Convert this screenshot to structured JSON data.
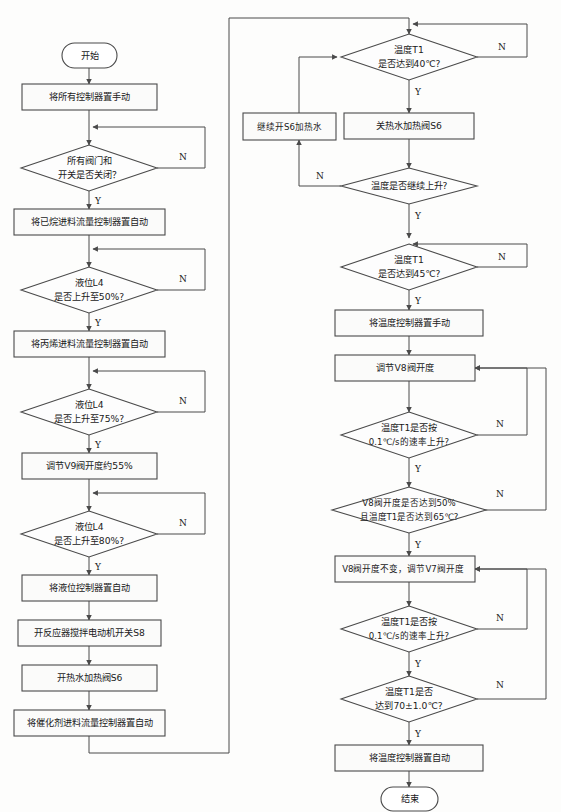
{
  "diagram": {
    "type": "flowchart",
    "orientation": "two-column",
    "colors": {
      "stroke": "#4a4a4a",
      "node_fill": "#ffffff",
      "background": "#fdfdfc",
      "text": "#1a1a1a"
    },
    "branch_labels": {
      "yes": "Y",
      "no": "N"
    }
  },
  "left_column": {
    "nodes": [
      {
        "id": "start",
        "shape": "terminator",
        "label": "开始"
      },
      {
        "id": "p1",
        "shape": "process",
        "label": "将所有控制器置手动"
      },
      {
        "id": "d1",
        "shape": "decision",
        "line1": "所有阀门和",
        "line2": "开关是否关闭？"
      },
      {
        "id": "p2",
        "shape": "process",
        "label": "将已烷进料流量控制器置自动"
      },
      {
        "id": "d2",
        "shape": "decision",
        "line1": "液位L4",
        "line2": "是否上升至50%?"
      },
      {
        "id": "p3",
        "shape": "process",
        "label": "将丙烯进料流量控制器置自动"
      },
      {
        "id": "d3",
        "shape": "decision",
        "line1": "液位L4",
        "line2": "是否上升至75%?"
      },
      {
        "id": "p4",
        "shape": "process",
        "label": "调节V9阀开度约55%"
      },
      {
        "id": "d4",
        "shape": "decision",
        "line1": "液位L4",
        "line2": "是否上升至80%?"
      },
      {
        "id": "p5",
        "shape": "process",
        "label": "将液位控制器置自动"
      },
      {
        "id": "p6",
        "shape": "process",
        "label": "开反应器搅拌电动机开关S8"
      },
      {
        "id": "p7",
        "shape": "process",
        "label": "开热水加热阀S6"
      },
      {
        "id": "p8",
        "shape": "process",
        "label": "将催化剂进料流量控制器置自动"
      }
    ]
  },
  "right_column": {
    "nodes": [
      {
        "id": "d5",
        "shape": "decision",
        "line1": "温度T1",
        "line2": "是否达到40℃?"
      },
      {
        "id": "p9",
        "shape": "process",
        "label": "关热水加热阀S6"
      },
      {
        "id": "p10",
        "shape": "process",
        "label": "继续开S6加热水"
      },
      {
        "id": "d6",
        "shape": "decision",
        "line1": "温度是否继续上升?",
        "line2": ""
      },
      {
        "id": "d7",
        "shape": "decision",
        "line1": "温度T1",
        "line2": "是否达到45℃?"
      },
      {
        "id": "p11",
        "shape": "process",
        "label": "将温度控制器置手动"
      },
      {
        "id": "p12",
        "shape": "process",
        "label": "调节V8阀开度"
      },
      {
        "id": "d8",
        "shape": "decision",
        "line1": "温度T1是否按",
        "line2": "0.1℃/s的速率上升?"
      },
      {
        "id": "d9",
        "shape": "decision",
        "line1": "V8阀开度是否达到50%",
        "line2": "且温度T1是否达到65℃?"
      },
      {
        "id": "p13",
        "shape": "process",
        "label": "V8阀开度不变，调节V7阀开度"
      },
      {
        "id": "d10",
        "shape": "decision",
        "line1": "温度T1是否按",
        "line2": "0.1℃/s的速率上升?"
      },
      {
        "id": "d11",
        "shape": "decision",
        "line1": "温度T1是否",
        "line2": "达到70±1.0℃?"
      },
      {
        "id": "p14",
        "shape": "process",
        "label": "将温度控制器置自动"
      },
      {
        "id": "end",
        "shape": "terminator",
        "label": "结束"
      }
    ]
  }
}
